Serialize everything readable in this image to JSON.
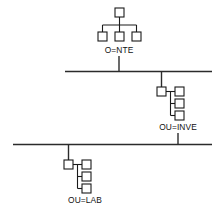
{
  "diagram": {
    "type": "network-hierarchy-diagram",
    "background_color": "#ffffff",
    "line_color": "#1a1a1a",
    "bus_color": "#2b2b2b",
    "groups": [
      {
        "id": "nte",
        "label": "O=NTE",
        "layout": "top-down-fanout",
        "parent_node": {
          "x": 115,
          "y": 8,
          "w": 9,
          "h": 9
        },
        "children": [
          {
            "x": 98,
            "y": 32,
            "w": 9,
            "h": 9
          },
          {
            "x": 115,
            "y": 32,
            "w": 9,
            "h": 9
          },
          {
            "x": 132,
            "y": 32,
            "w": 9,
            "h": 9
          }
        ],
        "label_x": 119,
        "label_y": 53,
        "drop_x": 119,
        "drop_from_y": 41,
        "drop_to_y": 71
      },
      {
        "id": "inve",
        "label": "OU=INVE",
        "layout": "left-parent-right-stack",
        "parent_node": {
          "x": 157,
          "y": 87,
          "w": 9,
          "h": 9
        },
        "children": [
          {
            "x": 175,
            "y": 87,
            "w": 9,
            "h": 9
          },
          {
            "x": 175,
            "y": 99,
            "w": 9,
            "h": 9
          },
          {
            "x": 175,
            "y": 111,
            "w": 9,
            "h": 9
          }
        ],
        "label_x": 178,
        "label_y": 130,
        "drop_x": 161,
        "drop_from_y": 72,
        "drop_to_y": 87,
        "bus_stub_x": 178,
        "bus_stub_from_y": 134,
        "bus_stub_to_y": 145
      },
      {
        "id": "lab",
        "label": "OU=LAB",
        "layout": "left-parent-right-stack",
        "parent_node": {
          "x": 64,
          "y": 160,
          "w": 9,
          "h": 9
        },
        "children": [
          {
            "x": 82,
            "y": 160,
            "w": 9,
            "h": 9
          },
          {
            "x": 82,
            "y": 172,
            "w": 9,
            "h": 9
          },
          {
            "x": 82,
            "y": 184,
            "w": 9,
            "h": 9
          }
        ],
        "label_x": 85,
        "label_y": 203,
        "drop_x": 68,
        "drop_from_y": 145,
        "drop_to_y": 160
      }
    ],
    "bus_lines": [
      {
        "id": "bus-upper",
        "x1": 65,
        "y1": 71.5,
        "x2": 212,
        "y2": 71.5
      },
      {
        "id": "bus-lower",
        "x1": 13,
        "y1": 144.5,
        "x2": 212,
        "y2": 144.5
      }
    ]
  }
}
